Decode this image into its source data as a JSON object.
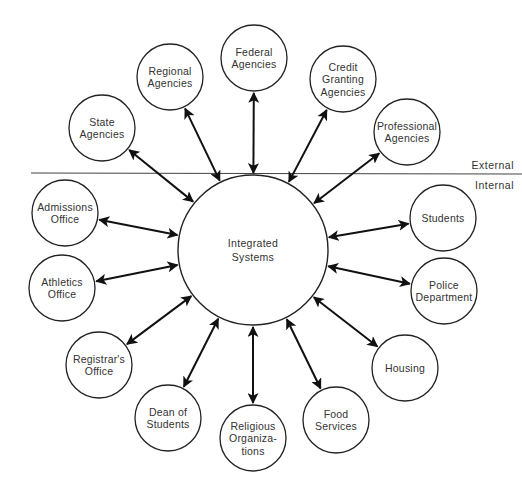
{
  "diagram": {
    "title": "",
    "center": {
      "id": "integrated-systems",
      "lines": [
        "Integrated",
        "Systems"
      ],
      "cx": 253,
      "cy": 250,
      "r": 75
    },
    "boundary": {
      "y": 173,
      "x1": 31,
      "x2": 522,
      "external_label": "External",
      "internal_label": "Internal"
    },
    "external_nodes": [
      {
        "id": "state-agencies",
        "lines": [
          "State",
          "Agencies"
        ],
        "cx": 102,
        "cy": 128,
        "r": 33
      },
      {
        "id": "regional-agencies",
        "lines": [
          "Regional",
          "Agencies"
        ],
        "cx": 170,
        "cy": 77,
        "r": 33
      },
      {
        "id": "federal-agencies",
        "lines": [
          "Federal",
          "Agencies"
        ],
        "cx": 254,
        "cy": 58,
        "r": 33
      },
      {
        "id": "credit-granting-agencies",
        "lines": [
          "Credit",
          "Granting",
          "Agencies"
        ],
        "cx": 343,
        "cy": 79,
        "r": 33
      },
      {
        "id": "professional-agencies",
        "lines": [
          "Professional",
          "Agencies"
        ],
        "cx": 407,
        "cy": 132,
        "r": 33
      }
    ],
    "internal_nodes": [
      {
        "id": "admissions-office",
        "lines": [
          "Admissions",
          "Office"
        ],
        "cx": 65,
        "cy": 213,
        "r": 33
      },
      {
        "id": "athletics-office",
        "lines": [
          "Athletics",
          "Office"
        ],
        "cx": 62,
        "cy": 288,
        "r": 33
      },
      {
        "id": "registrars-office",
        "lines": [
          "Registrar's",
          "Office"
        ],
        "cx": 99,
        "cy": 365,
        "r": 33
      },
      {
        "id": "dean-of-students",
        "lines": [
          "Dean of",
          "Students"
        ],
        "cx": 168,
        "cy": 418,
        "r": 33
      },
      {
        "id": "religious-organizations",
        "lines": [
          "Religious",
          "Organiza-",
          "tions"
        ],
        "cx": 253,
        "cy": 438,
        "r": 33
      },
      {
        "id": "food-services",
        "lines": [
          "Food",
          "Services"
        ],
        "cx": 336,
        "cy": 420,
        "r": 33
      },
      {
        "id": "housing",
        "lines": [
          "Housing"
        ],
        "cx": 405,
        "cy": 368,
        "r": 33
      },
      {
        "id": "police-department",
        "lines": [
          "Police",
          "Department"
        ],
        "cx": 444,
        "cy": 291,
        "r": 33
      },
      {
        "id": "students",
        "lines": [
          "Students"
        ],
        "cx": 443,
        "cy": 218,
        "r": 33
      }
    ],
    "connections": {
      "type": "bidirectional-arrow",
      "from": "integrated-systems",
      "to": "all-nodes"
    },
    "colors": {
      "stroke": "#222222",
      "text": "#333333",
      "background": "#ffffff"
    }
  }
}
